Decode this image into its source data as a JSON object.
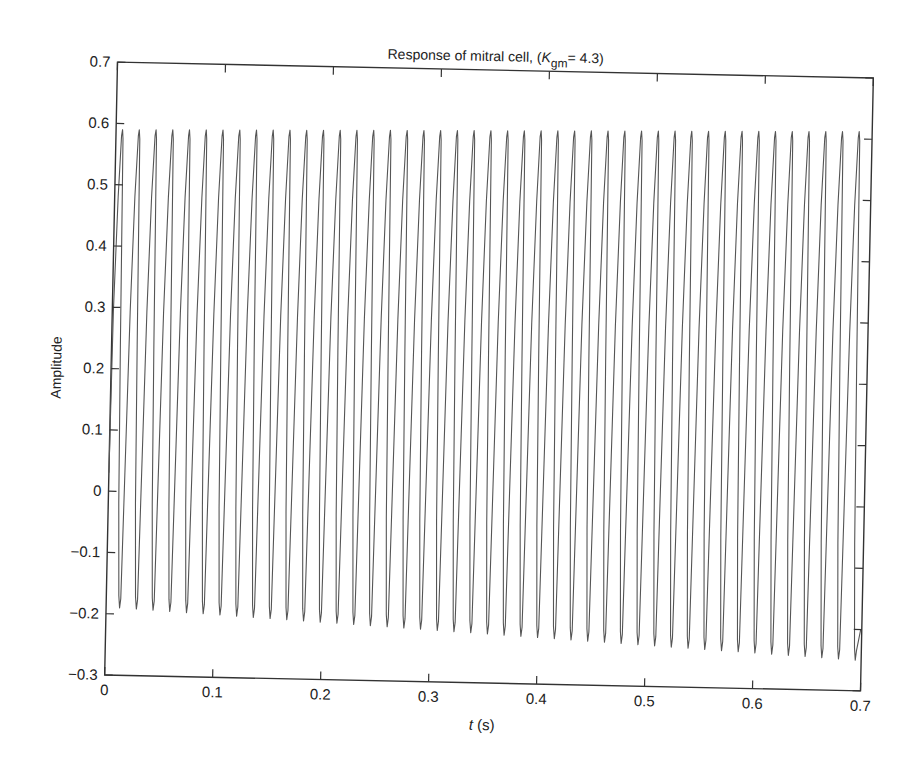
{
  "chart_data": {
    "type": "line",
    "title_parts": {
      "prefix": "Response of mitral cell, (",
      "var": "K",
      "sub": "gm",
      "suffix": "= 4.3)"
    },
    "xlabel": "t (s)",
    "xlabel_parts": {
      "var": "t",
      "unit": " (s)"
    },
    "ylabel": "Amplitude",
    "xlim": [
      0,
      0.7
    ],
    "ylim": [
      -0.3,
      0.7
    ],
    "xticks": [
      0,
      0.1,
      0.2,
      0.3,
      0.4,
      0.5,
      0.6,
      0.7
    ],
    "xtick_labels": [
      "0",
      "0.1",
      "0.2",
      "0.3",
      "0.4",
      "0.5",
      "0.6",
      "0.7"
    ],
    "yticks": [
      -0.3,
      -0.2,
      -0.1,
      0,
      0.1,
      0.2,
      0.3,
      0.4,
      0.5,
      0.6,
      0.7
    ],
    "ytick_labels": [
      "−0.3",
      "−0.2",
      "−0.1",
      "0",
      "0.1",
      "0.2",
      "0.3",
      "0.4",
      "0.5",
      "0.6",
      "0.7"
    ],
    "grid": false,
    "legend": null,
    "series": [
      {
        "name": "mitral cell response",
        "color": "#555555",
        "description": "Periodic spike train, ~45 sharp oscillations over 0-0.7 s (~64 Hz)",
        "num_cycles": 45,
        "period_s": 0.0155,
        "first_peak_t": 0.006,
        "peak_start": 0.59,
        "peak_end": 0.612,
        "trough_start": -0.19,
        "trough_end": -0.25,
        "start_value": 0.03,
        "end_value": -0.2
      }
    ],
    "rotation_deg": 1.2
  },
  "colors": {
    "axis": "#333333",
    "trace": "#5a5a5a",
    "text": "#222222"
  }
}
